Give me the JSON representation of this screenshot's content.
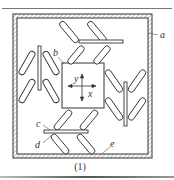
{
  "figure": {
    "caption": "(1)",
    "labels": {
      "a": "a",
      "b": "b",
      "c": "c",
      "d": "d",
      "e": "e"
    },
    "axes": {
      "x_label": "x",
      "y_label": "y"
    },
    "colors": {
      "line": "#333333",
      "hatch": "#777777",
      "background": "#ffffff"
    }
  }
}
